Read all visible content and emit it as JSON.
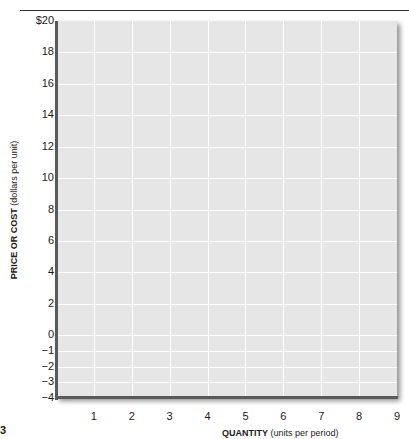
{
  "chart_data": {
    "type": "line",
    "title": "",
    "xlabel": "QUANTITY (units per period)",
    "xlabel_bold": "QUANTITY",
    "xlabel_rest": " (units per period)",
    "ylabel": "PRICE OR COST (dollars per unit)",
    "ylabel_bold": "PRICE OR COST",
    "ylabel_rest": " (dollars per unit)",
    "x_ticks": [
      "1",
      "2",
      "3",
      "4",
      "5",
      "6",
      "7",
      "8",
      "9"
    ],
    "y_ticks": [
      "$20",
      "18",
      "16",
      "14",
      "12",
      "10",
      "8",
      "6",
      "4",
      "2",
      "0",
      "−1",
      "−2",
      "−3",
      "−4"
    ],
    "xlim": [
      0,
      9
    ],
    "ylim": [
      -4,
      20
    ],
    "grid": true,
    "series": [],
    "legend": null,
    "colors": {
      "plot_bg": "#e6e6e6",
      "grid": "#ffffff",
      "axis": "#5a5a5a"
    }
  },
  "page": {
    "corner_mark": "3"
  }
}
